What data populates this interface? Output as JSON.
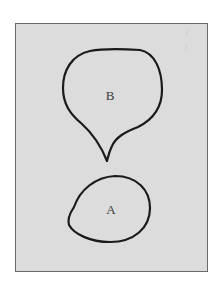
{
  "diagram": {
    "background_color": "#dcdcdc",
    "border_color": "#6a6a6a",
    "stroke_color": "#1a1a1a",
    "label_color": "#3a3a3a",
    "shapes": [
      {
        "id": "B",
        "label": "B",
        "description": "teardrop shape with pointed tip at bottom"
      },
      {
        "id": "A",
        "label": "A",
        "description": "irregular rounded oval"
      }
    ]
  }
}
